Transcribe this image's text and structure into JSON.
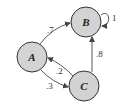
{
  "diagram": {
    "type": "markov-chain",
    "nodes": [
      {
        "id": "A",
        "label": "A"
      },
      {
        "id": "B",
        "label": "B"
      },
      {
        "id": "C",
        "label": "C"
      }
    ],
    "edges": [
      {
        "from": "A",
        "to": "B",
        "label": ".7"
      },
      {
        "from": "B",
        "to": "B",
        "label": "1"
      },
      {
        "from": "C",
        "to": "B",
        "label": ".8"
      },
      {
        "from": "C",
        "to": "A",
        "label": ".2"
      },
      {
        "from": "A",
        "to": "C",
        "label": ".3"
      }
    ],
    "colors": {
      "node_fill": "#d3d3d3",
      "stroke": "#333333"
    }
  }
}
